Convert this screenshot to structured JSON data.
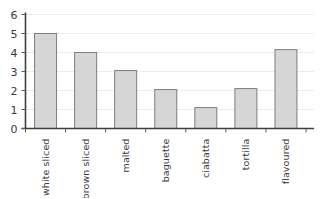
{
  "chart_data": {
    "type": "bar",
    "title": "",
    "subtitle": "",
    "xlabel": "",
    "ylabel": "",
    "categories": [
      "white sliced",
      "brown sliced",
      "malted",
      "baguette",
      "ciabatta",
      "tortilla",
      "flavoured"
    ],
    "values": [
      5.0,
      4.0,
      3.05,
      2.05,
      1.1,
      2.1,
      4.15
    ],
    "ylim": [
      0,
      6
    ],
    "ytick_labels": [
      "0",
      "1",
      "2",
      "3",
      "4",
      "5",
      "6"
    ],
    "ytick_values": [
      0,
      1,
      2,
      3,
      4,
      5,
      6
    ],
    "grid": true,
    "grid_axis": "y",
    "legend": false,
    "legend_position": "none",
    "category_label_rotation": -90,
    "bar_fill_color": "#d6d6d6",
    "bar_border_color": "#7d7d7d",
    "axis_color": "#3d3d3d",
    "grid_color": "#ededed",
    "text_color": "#3a3a3a",
    "background_color": "#ffffff"
  }
}
